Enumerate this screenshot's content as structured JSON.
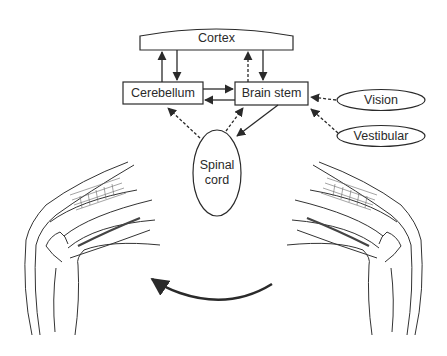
{
  "diagram": {
    "nodes": {
      "cortex": {
        "label": "Cortex"
      },
      "cerebellum": {
        "label": "Cerebellum"
      },
      "brain_stem": {
        "label": "Brain stem"
      },
      "spinal_cord": {
        "label_line1": "Spinal",
        "label_line2": "cord"
      },
      "vision": {
        "label": "Vision"
      },
      "vestibular": {
        "label": "Vestibular"
      }
    },
    "edges": [
      {
        "from": "Cerebellum",
        "to": "Cortex",
        "style": "solid"
      },
      {
        "from": "Cortex",
        "to": "Cerebellum",
        "style": "solid"
      },
      {
        "from": "Brain stem",
        "to": "Cortex",
        "style": "dashed"
      },
      {
        "from": "Cortex",
        "to": "Brain stem",
        "style": "solid"
      },
      {
        "from": "Cerebellum",
        "to": "Brain stem",
        "style": "solid"
      },
      {
        "from": "Brain stem",
        "to": "Cerebellum",
        "style": "solid"
      },
      {
        "from": "Spinal cord",
        "to": "Cerebellum",
        "style": "dashed"
      },
      {
        "from": "Spinal cord",
        "to": "Brain stem",
        "style": "dashed"
      },
      {
        "from": "Brain stem",
        "to": "Spinal cord",
        "style": "solid"
      },
      {
        "from": "Vision",
        "to": "Brain stem",
        "style": "dashed"
      },
      {
        "from": "Vestibular",
        "to": "Brain stem",
        "style": "dashed"
      }
    ],
    "illustrations": {
      "left": "knee-joint-flexed-left",
      "right": "knee-joint-flexed-right",
      "arrow": "curved-arrow-right-to-left"
    },
    "colors": {
      "line": "#2a2a2a",
      "background": "#ffffff"
    }
  }
}
